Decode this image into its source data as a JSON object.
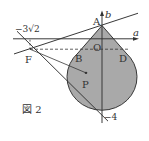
{
  "figure": {
    "caption": "図 2",
    "axes": {
      "x_label": "a",
      "y_label": "b",
      "origin_label": "O",
      "x_tick": "−3√2",
      "y_tick": "−4"
    },
    "points": {
      "A": "A",
      "B": "B",
      "D": "D",
      "F": "F",
      "P": "P"
    },
    "colors": {
      "fill": "#a9a9a9",
      "stroke": "#333333",
      "background": "#ffffff"
    }
  }
}
